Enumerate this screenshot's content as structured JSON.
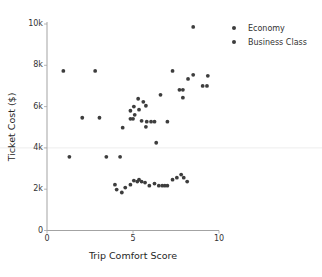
{
  "chart_data": {
    "type": "scatter",
    "title": "",
    "xlabel": "Trip Comfort Score",
    "ylabel": "Ticket Cost ($)",
    "xlim": [
      0,
      10
    ],
    "ylim": [
      0,
      10000
    ],
    "xticks": [
      {
        "value": 0,
        "label": "0"
      },
      {
        "value": 5,
        "label": "5"
      },
      {
        "value": 10,
        "label": "10"
      }
    ],
    "yticks": [
      {
        "value": 0,
        "label": "0"
      },
      {
        "value": 2000,
        "label": "2k"
      },
      {
        "value": 4000,
        "label": "4k"
      },
      {
        "value": 6000,
        "label": "6k"
      },
      {
        "value": 8000,
        "label": "8k"
      },
      {
        "value": 10000,
        "label": "10k"
      }
    ],
    "grid": "off",
    "reference_line_y": 4000,
    "legend_position": "upper right",
    "legend_entries": [
      "Economy",
      "Business Class"
    ],
    "colors": {
      "marker": "#3d3d3d",
      "spine": "#a3a3a3",
      "reference_line": "#ededed",
      "background": "#ffffff",
      "text": "#333333"
    },
    "series": [
      {
        "name": "Economy",
        "points": [
          [
            1.3,
            3570
          ],
          [
            3.45,
            3570
          ],
          [
            4.25,
            3570
          ],
          [
            3.95,
            2220
          ],
          [
            4.05,
            1980
          ],
          [
            4.35,
            1840
          ],
          [
            4.55,
            2080
          ],
          [
            4.85,
            2220
          ],
          [
            5.05,
            2420
          ],
          [
            5.25,
            2370
          ],
          [
            5.35,
            2460
          ],
          [
            5.5,
            2370
          ],
          [
            5.7,
            2320
          ],
          [
            5.95,
            2170
          ],
          [
            6.25,
            2270
          ],
          [
            6.5,
            2170
          ],
          [
            6.7,
            2170
          ],
          [
            6.85,
            2170
          ],
          [
            7.0,
            2170
          ],
          [
            7.3,
            2460
          ],
          [
            7.55,
            2560
          ],
          [
            7.8,
            2710
          ],
          [
            7.95,
            2560
          ],
          [
            8.15,
            2370
          ]
        ]
      },
      {
        "name": "Business Class",
        "points": [
          [
            0.95,
            7730
          ],
          [
            2.8,
            7730
          ],
          [
            2.05,
            5460
          ],
          [
            3.05,
            5460
          ],
          [
            4.4,
            4980
          ],
          [
            4.85,
            5410
          ],
          [
            4.85,
            5800
          ],
          [
            5.0,
            5410
          ],
          [
            5.05,
            6000
          ],
          [
            5.1,
            5600
          ],
          [
            5.3,
            6380
          ],
          [
            5.35,
            5850
          ],
          [
            5.5,
            5310
          ],
          [
            5.6,
            6230
          ],
          [
            5.75,
            6040
          ],
          [
            5.75,
            5020
          ],
          [
            5.8,
            5270
          ],
          [
            6.05,
            5270
          ],
          [
            6.25,
            5270
          ],
          [
            6.35,
            4250
          ],
          [
            6.6,
            6570
          ],
          [
            7.0,
            5270
          ],
          [
            7.3,
            7730
          ],
          [
            7.7,
            6810
          ],
          [
            7.9,
            6810
          ],
          [
            7.9,
            6430
          ],
          [
            8.2,
            7340
          ],
          [
            8.5,
            9860
          ],
          [
            8.5,
            7540
          ],
          [
            9.05,
            7000
          ],
          [
            9.3,
            7000
          ],
          [
            9.35,
            7490
          ]
        ]
      }
    ]
  }
}
